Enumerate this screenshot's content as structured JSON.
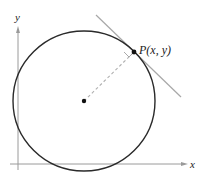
{
  "diagram": {
    "axes": {
      "x_label": "x",
      "y_label": "y"
    },
    "point": {
      "label": "P(x, y)"
    },
    "elements": [
      "circle",
      "center-point",
      "radius-dashed",
      "tangent-line",
      "right-angle-marker"
    ],
    "colors": {
      "circle": "#2a2a2a",
      "axes": "#9a9a9a",
      "tangent": "#a8a8a8",
      "radius": "#b0b0b0",
      "text": "#222222"
    }
  }
}
